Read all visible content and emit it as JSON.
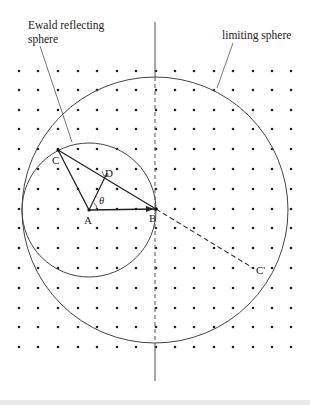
{
  "figure": {
    "labels": {
      "ewald_line1": "Ewald reflecting",
      "ewald_line2": "sphere",
      "limiting": "limiting sphere",
      "A": "A",
      "B": "B",
      "C": "C",
      "D": "D",
      "C_prime": "C'",
      "theta": "θ"
    },
    "colors": {
      "ink": "#333333",
      "dot": "#222222",
      "background": "#ffffff"
    },
    "lattice": {
      "columns_x": [
        19,
        38,
        58,
        78,
        97,
        117,
        136,
        156,
        175,
        194,
        214,
        233,
        253,
        272,
        291
      ],
      "rows_y": [
        71,
        90,
        110,
        129,
        149,
        169,
        189,
        209,
        228,
        248,
        268,
        288,
        308,
        327,
        347
      ]
    },
    "points": {
      "A": [
        89,
        210
      ],
      "B": [
        156,
        209
      ],
      "C": [
        58,
        150
      ],
      "D": [
        107,
        173
      ],
      "C_prime": [
        253,
        268
      ]
    },
    "circles": {
      "ewald": {
        "cx": 89,
        "cy": 210,
        "r": 67
      },
      "limiting": {
        "cx": 155,
        "cy": 210,
        "r": 133
      }
    }
  }
}
